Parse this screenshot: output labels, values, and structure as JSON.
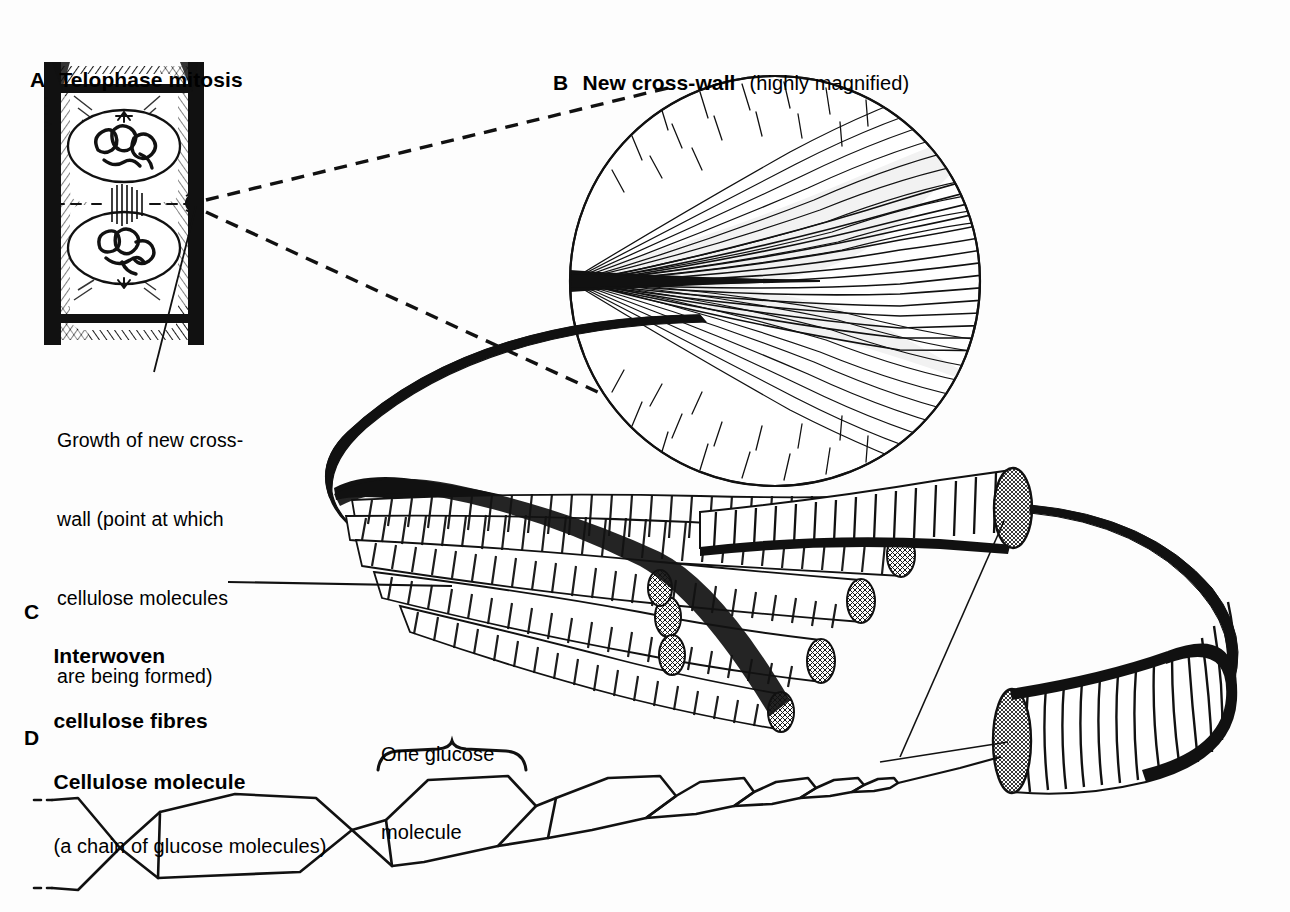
{
  "figure": {
    "title_semantic": "cellulose-structure-plate",
    "background_color": "#fdfdfd",
    "ink_color": "#111111",
    "width": 1290,
    "height": 912
  },
  "panels": {
    "a": {
      "letter": "A",
      "title": "Telophase mitosis",
      "annotation_lines": [
        "Growth of new cross-",
        "wall (point at which",
        "cellulose molecules",
        "are being formed)"
      ]
    },
    "b": {
      "letter": "B",
      "title": "New cross-wall",
      "subtitle": "(highly magnified)"
    },
    "c": {
      "letter": "C",
      "title_line1": "Interwoven",
      "title_line2": "cellulose fibres"
    },
    "d": {
      "letter": "D",
      "title": "Cellulose molecule",
      "subtitle": "(a chain of glucose molecules)",
      "callout_line1": "One glucose",
      "callout_line2": "molecule"
    }
  }
}
